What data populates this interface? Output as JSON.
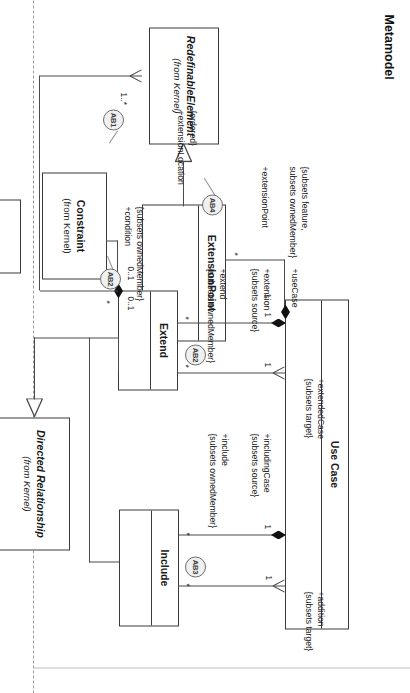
{
  "page": {
    "title": "Metamodel",
    "diagram_type": "uml-class-diagram",
    "orientation": "rotated-90-clockwise",
    "background": "#ffffff",
    "line_color": "#4a4a4a",
    "text_color": "#1a1a1a",
    "badge_fill": "#f0f0f0"
  },
  "classes": [
    {
      "id": "use-case",
      "name": "Use Case",
      "stereotype": "",
      "italic": false,
      "compartments": 2
    },
    {
      "id": "include",
      "name": "Include",
      "stereotype": "",
      "italic": false,
      "compartments": 2
    },
    {
      "id": "extend",
      "name": "Extend",
      "stereotype": "",
      "italic": false,
      "compartments": 2
    },
    {
      "id": "directed-relationship",
      "name": "Directed Relationship",
      "stereotype": "(from Kernel)",
      "italic": true,
      "compartments": 1
    },
    {
      "id": "constraint",
      "name": "Constraint",
      "stereotype": "(from Kernel)",
      "italic": false,
      "compartments": 1
    },
    {
      "id": "extension-point",
      "name": "ExtensionPoint",
      "stereotype": "",
      "italic": false,
      "compartments": 2
    },
    {
      "id": "redefinable-element",
      "name": "RedefinableElement",
      "stereotype": "(from Kernel)",
      "italic": true,
      "compartments": 1
    }
  ],
  "badges": [
    {
      "id": "ab1",
      "label": "AB1"
    },
    {
      "id": "ab2",
      "label": "AB2"
    },
    {
      "id": "ab3",
      "label": "AB3"
    },
    {
      "id": "ab4",
      "label": "AB4"
    },
    {
      "id": "ab2b",
      "label": "AB2"
    }
  ],
  "association_labels": [
    {
      "id": "addition",
      "role": "+addition",
      "constraint": "{subsets target}"
    },
    {
      "id": "includingCase",
      "role": "+includingCase",
      "constraint": "{subsets source}"
    },
    {
      "id": "include",
      "role": "+include",
      "constraint": "{subsets ownedMember}"
    },
    {
      "id": "extendedCase",
      "role": "+extendedCase",
      "constraint": "{subsets target}"
    },
    {
      "id": "extension",
      "role": "+extension",
      "constraint": "{subsets source}"
    },
    {
      "id": "extend",
      "role": "+extend",
      "constraint": "{subsets ownedMember}"
    },
    {
      "id": "condition",
      "role": "+condition",
      "constraint": "{subsets ownedMember}"
    },
    {
      "id": "useCase",
      "role": "+useCase",
      "constraint": "{subsets feature,\nsubsets ownedMember}"
    },
    {
      "id": "extensionPoint",
      "role": "+extensionPoint",
      "constraint": ""
    },
    {
      "id": "extensionLocation",
      "role": "+extensionLocation",
      "constraint": "{ordered}"
    }
  ],
  "multiplicities": {
    "addition_end": "1",
    "includingCase_end": "1",
    "include_star_a": "*",
    "include_star_b": "*",
    "extendedCase_end": "1",
    "extension_end": "1",
    "extend_star_a": "*",
    "extend_star_b": "*",
    "extend_owner": "*",
    "condition_lo": "0..1",
    "condition_hi": "0..1",
    "useCase_one": "1",
    "extensionPoint_star": "*",
    "extensionLocation_many": "1..*"
  },
  "constraint_texts": {
    "subsets_feature_line1": "{subsets feature,",
    "subsets_feature_line2": "subsets ownedMember}",
    "ordered": "{ordered}"
  }
}
